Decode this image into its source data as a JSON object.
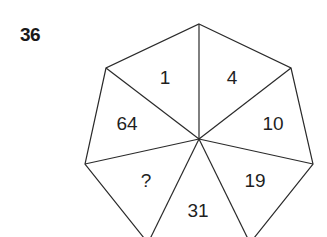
{
  "puzzle": {
    "number": "36",
    "shape": "heptagon",
    "segments": [
      {
        "position": "top-left",
        "value": "1"
      },
      {
        "position": "top-right",
        "value": "4"
      },
      {
        "position": "right",
        "value": "10"
      },
      {
        "position": "lower-right",
        "value": "19"
      },
      {
        "position": "bottom",
        "value": "31"
      },
      {
        "position": "lower-left",
        "value": "?"
      },
      {
        "position": "left",
        "value": "64"
      }
    ]
  }
}
